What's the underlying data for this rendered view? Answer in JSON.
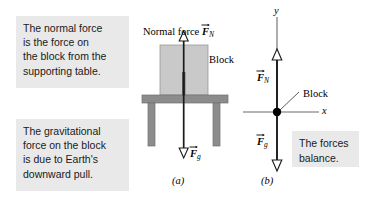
{
  "figure": {
    "background_color": "#ffffff"
  },
  "callouts": [
    {
      "id": "normal-force-callout",
      "text": "The normal force\nis the force on\nthe block from the\nsupporting table.",
      "background_color": "#e9e9e9"
    },
    {
      "id": "gravity-callout",
      "text": "The gravitational\nforce on the block\nis due to Earth's\ndownward pull.",
      "background_color": "#e9e9e9"
    },
    {
      "id": "balance-callout",
      "text": "The forces\nbalance.",
      "background_color": "#e9e9e9"
    }
  ],
  "panel_a": {
    "caption": "(a)",
    "normal_force_label_prefix": "Normal force ",
    "normal_force_symbol": "F",
    "normal_force_subscript": "N",
    "block_label": "Block",
    "gravity_symbol": "F",
    "gravity_subscript": "g",
    "block_color": "#c9c9c9",
    "table_color": "#8c8c8c",
    "arrow_color": "#000000"
  },
  "panel_b": {
    "caption": "(b)",
    "y_axis_label": "y",
    "x_axis_label": "x",
    "normal_force_symbol": "F",
    "normal_force_subscript": "N",
    "gravity_symbol": "F",
    "gravity_subscript": "g",
    "block_label": "Block",
    "axis_color": "#5a5a5a",
    "dot_color": "#000000",
    "arrow_color": "#000000"
  }
}
